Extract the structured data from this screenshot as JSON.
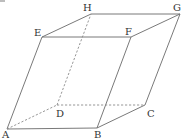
{
  "diagram": {
    "type": "parallelepiped",
    "line_color": "#6a6a6a",
    "vertices": {
      "A": {
        "x": 7,
        "y": 129
      },
      "B": {
        "x": 97,
        "y": 128
      },
      "C": {
        "x": 145,
        "y": 105
      },
      "D": {
        "x": 57,
        "y": 105
      },
      "E": {
        "x": 42,
        "y": 37
      },
      "F": {
        "x": 131,
        "y": 37
      },
      "G": {
        "x": 180,
        "y": 14
      },
      "H": {
        "x": 91,
        "y": 14
      }
    },
    "labels": {
      "A": "A",
      "B": "B",
      "C": "C",
      "D": "D",
      "E": "E",
      "F": "F",
      "G": "G",
      "H": "H"
    },
    "solid_edges": [
      "AB",
      "BC",
      "EF",
      "FG",
      "GH",
      "HE",
      "AE",
      "BF",
      "CG"
    ],
    "hidden_edges": [
      "AD",
      "DC",
      "DH"
    ]
  }
}
